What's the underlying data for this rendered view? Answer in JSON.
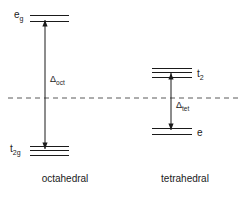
{
  "figure": {
    "background_color": "#ffffff",
    "line_color": "#1a1a1a",
    "baseline_color": "#5a5a5a",
    "width": 244,
    "height": 197
  },
  "chart_data": {
    "type": "diagram",
    "subtype": "crystal-field-splitting-energy-level-diagram",
    "title": "",
    "xlabel": "",
    "ylabel": "",
    "grid": false,
    "legend": null,
    "baseline": {
      "label": "barycenter",
      "style": "dashed",
      "y_pixel": 98,
      "x_start_pixel": 8,
      "x_end_pixel": 238
    },
    "fields": [
      {
        "name": "octahedral",
        "caption": "octahedral",
        "caption_x": 65,
        "caption_y": 182,
        "center_x": 49,
        "splitting_label": "Δ",
        "splitting_subscript": "oct",
        "splitting_label_x": 50,
        "splitting_label_y": 82,
        "arrow_x": 45,
        "arrow_top_y": 20,
        "arrow_bottom_y": 149,
        "levels": [
          {
            "label": "e",
            "subscript": "g",
            "degeneracy": 2,
            "position": "upper",
            "label_x": 14,
            "label_y": 18,
            "label_anchor": "start",
            "line_x_start": 30,
            "line_x_end": 69,
            "line_y_values": [
              15,
              21
            ]
          },
          {
            "label": "t",
            "subscript": "2g",
            "degeneracy": 3,
            "position": "lower",
            "label_x": 10,
            "label_y": 152,
            "label_anchor": "start",
            "line_x_start": 30,
            "line_x_end": 69,
            "line_y_values": [
              146,
              150,
              155
            ]
          }
        ]
      },
      {
        "name": "tetrahedral",
        "caption": "tetrahedral",
        "caption_x": 185,
        "caption_y": 182,
        "center_x": 173,
        "splitting_label": "Δ",
        "splitting_subscript": "tet",
        "splitting_label_x": 176,
        "splitting_label_y": 108,
        "arrow_x": 171,
        "arrow_top_y": 73,
        "arrow_bottom_y": 130,
        "levels": [
          {
            "label": "t",
            "subscript": "2",
            "degeneracy": 3,
            "position": "upper",
            "label_x": 197,
            "label_y": 77,
            "label_anchor": "start",
            "line_x_start": 152,
            "line_x_end": 192,
            "line_y_values": [
              68,
              72,
              77
            ]
          },
          {
            "label": "e",
            "subscript": "",
            "degeneracy": 2,
            "position": "lower",
            "label_x": 197,
            "label_y": 136,
            "label_anchor": "start",
            "line_x_start": 152,
            "line_x_end": 192,
            "line_y_values": [
              128,
              134
            ]
          }
        ]
      }
    ]
  }
}
